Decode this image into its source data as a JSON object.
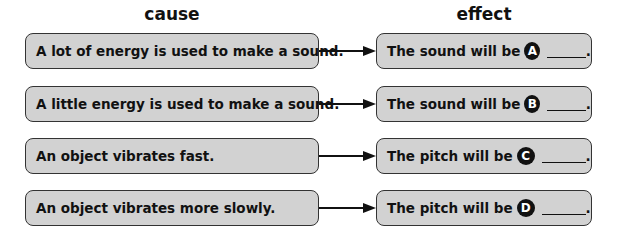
{
  "headers": {
    "cause": "cause",
    "effect": "effect"
  },
  "rows": [
    {
      "cause": "A lot of energy is used to make a sound.",
      "effect_prefix": "The sound will be",
      "letter": "A",
      "effect_suffix": "."
    },
    {
      "cause": "A little energy is used to make a sound.",
      "effect_prefix": "The sound will be",
      "letter": "B",
      "effect_suffix": "."
    },
    {
      "cause": "An object vibrates fast.",
      "effect_prefix": "The pitch will be",
      "letter": "C",
      "effect_suffix": "."
    },
    {
      "cause": "An object vibrates more slowly.",
      "effect_prefix": "The pitch will be",
      "letter": "D",
      "effect_suffix": "."
    }
  ],
  "colors": {
    "box_fill": "#d2d2d2",
    "box_border": "#333333",
    "letter_bg": "#111111"
  }
}
